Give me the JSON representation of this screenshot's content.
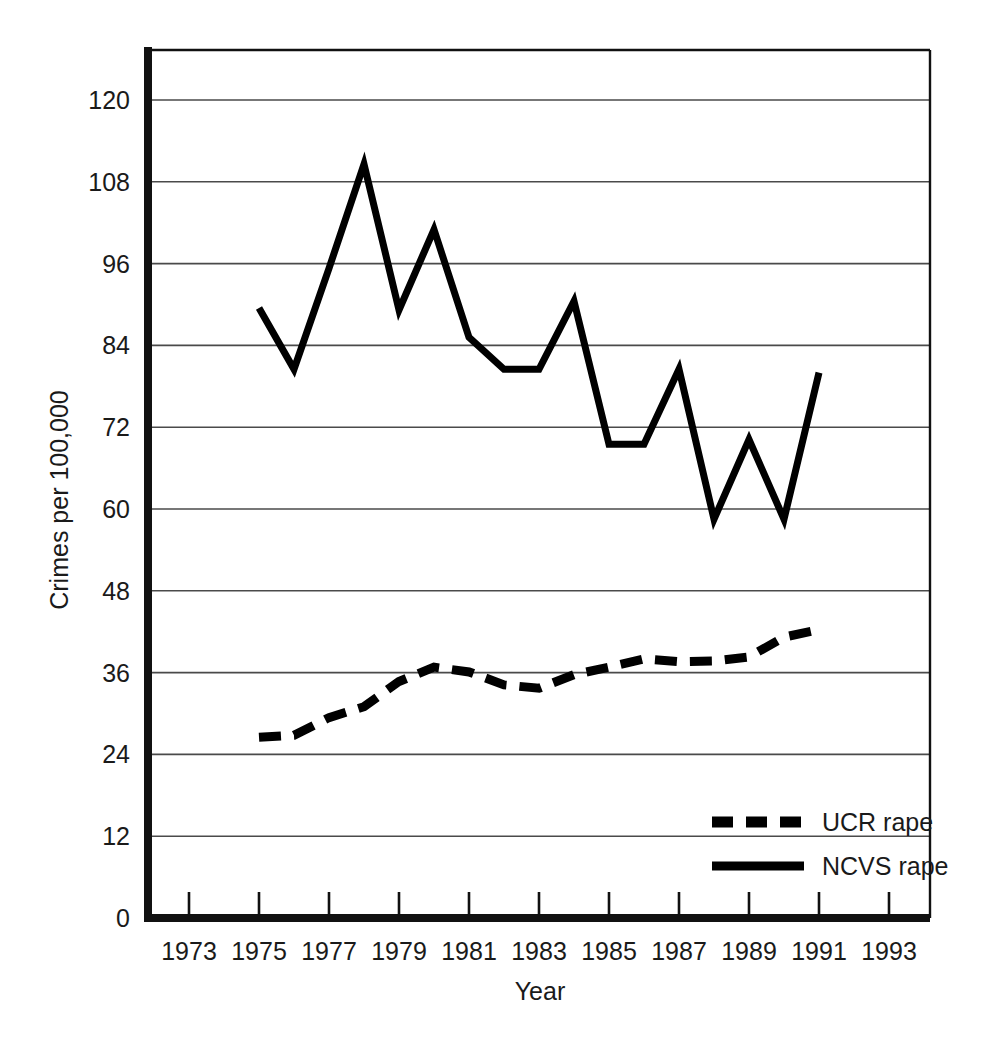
{
  "chart_data": {
    "type": "line",
    "title": "",
    "xlabel": "Year",
    "ylabel": "Crimes per 100,000",
    "xlim": [
      1972,
      1994
    ],
    "ylim": [
      0,
      126
    ],
    "grid": "horizontal",
    "legend_position": "bottom-right",
    "x_ticks": [
      1973,
      1975,
      1977,
      1979,
      1981,
      1983,
      1985,
      1987,
      1989,
      1991,
      1993
    ],
    "x_tick_labels": [
      "1973",
      "1975",
      "1977",
      "1979",
      "1981",
      "1983",
      "1985",
      "1987",
      "1989",
      "1991",
      "1993"
    ],
    "y_ticks": [
      0,
      12,
      24,
      36,
      48,
      60,
      72,
      84,
      96,
      108,
      120
    ],
    "y_tick_labels": [
      "0",
      "12",
      "24",
      "36",
      "48",
      "60",
      "72",
      "84",
      "96",
      "108",
      "120"
    ],
    "series": [
      {
        "name": "UCR rape",
        "style": "dashed",
        "color": "#000000",
        "x": [
          1975,
          1976,
          1977,
          1978,
          1979,
          1980,
          1981,
          1982,
          1983,
          1984,
          1985,
          1986,
          1987,
          1988,
          1989,
          1990,
          1991
        ],
        "values": [
          26.5,
          26.8,
          29.4,
          31.0,
          34.7,
          36.8,
          36.1,
          34.2,
          33.7,
          35.7,
          36.8,
          38.0,
          37.6,
          37.7,
          38.3,
          41.2,
          42.3
        ]
      },
      {
        "name": "NCVS rape",
        "style": "solid",
        "color": "#000000",
        "x": [
          1975,
          1976,
          1977,
          1978,
          1979,
          1980,
          1981,
          1982,
          1983,
          1984,
          1985,
          1986,
          1987,
          1988,
          1989,
          1990,
          1991
        ],
        "values": [
          89.5,
          80.5,
          95.3,
          110.6,
          89.2,
          101.0,
          85.2,
          80.5,
          80.5,
          90.5,
          69.5,
          69.5,
          80.5,
          58.5,
          70.2,
          58.5,
          80.0
        ]
      }
    ]
  },
  "legend": {
    "entries": [
      {
        "label": "UCR rape",
        "style": "dashed"
      },
      {
        "label": "NCVS rape",
        "style": "solid"
      }
    ]
  },
  "axes": {
    "x_title": "Year",
    "y_title": "Crimes per 100,000"
  }
}
